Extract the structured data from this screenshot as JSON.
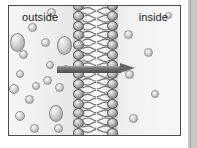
{
  "figure": {
    "labels": {
      "left_compartment": "outside",
      "right_compartment": "inside"
    },
    "arrow": {
      "name": "net-diffusion-arrow",
      "direction": "left-to-right",
      "meaning": "net movement of solute from outside to inside",
      "color": "#666666",
      "x_start": 57,
      "x_end": 136,
      "y": 69
    },
    "membrane": {
      "name": "phospholipid-bilayer",
      "orientation": "vertical",
      "x_left": 64,
      "x_right": 109,
      "width": 45,
      "head_count_per_leaflet": 16,
      "head_color": "#8d8d8d",
      "tail_color": "#5a5a5a",
      "description": "two leaflets of phospholipid heads with interdigitated wavy hydrophobic tails"
    },
    "colors": {
      "page_background": "#ffffff",
      "outer_background": "#c9c9c9",
      "frame_border": "#4c4c4c",
      "figure_fill": "#f2f2f2",
      "molecule_fill": "#d8d8d8",
      "molecule_stroke": "#8f8f8f",
      "arrow": "#666666",
      "text": "#1b1b1b"
    },
    "concentration": {
      "outside": "high",
      "inside": "low",
      "outside_molecule_count": 18,
      "inside_molecule_count": 6
    },
    "molecules_outside": [
      {
        "x": 1,
        "y": 27,
        "w": 15,
        "h": 19,
        "shape": "oval"
      },
      {
        "x": 10,
        "y": 44,
        "w": 9,
        "h": 9,
        "shape": "circle"
      },
      {
        "x": 19,
        "y": 17,
        "w": 9,
        "h": 9,
        "shape": "circle"
      },
      {
        "x": 7,
        "y": 64,
        "w": 8,
        "h": 8,
        "shape": "circle"
      },
      {
        "x": 0,
        "y": 78,
        "w": 10,
        "h": 10,
        "shape": "circle"
      },
      {
        "x": 16,
        "y": 89,
        "w": 9,
        "h": 9,
        "shape": "circle"
      },
      {
        "x": 6,
        "y": 105,
        "w": 10,
        "h": 10,
        "shape": "circle"
      },
      {
        "x": 21,
        "y": 118,
        "w": 9,
        "h": 9,
        "shape": "circle"
      },
      {
        "x": 32,
        "y": 32,
        "w": 9,
        "h": 9,
        "shape": "circle"
      },
      {
        "x": 37,
        "y": 55,
        "w": 8,
        "h": 8,
        "shape": "circle"
      },
      {
        "x": 34,
        "y": 70,
        "w": 9,
        "h": 9,
        "shape": "circle"
      },
      {
        "x": 40,
        "y": 99,
        "w": 14,
        "h": 17,
        "shape": "oval"
      },
      {
        "x": 38,
        "y": 2,
        "w": 9,
        "h": 9,
        "shape": "circle"
      },
      {
        "x": 48,
        "y": 30,
        "w": 15,
        "h": 19,
        "shape": "oval"
      },
      {
        "x": 46,
        "y": 77,
        "w": 9,
        "h": 9,
        "shape": "circle"
      },
      {
        "x": 45,
        "y": 118,
        "w": 9,
        "h": 9,
        "shape": "circle"
      },
      {
        "x": 53,
        "y": 59,
        "w": 8,
        "h": 8,
        "shape": "circle"
      },
      {
        "x": 23,
        "y": 76,
        "w": 8,
        "h": 8,
        "shape": "circle"
      }
    ],
    "molecules_inside": [
      {
        "x": 6,
        "y": 24,
        "w": 9,
        "h": 9,
        "shape": "circle"
      },
      {
        "x": 26,
        "y": 42,
        "w": 9,
        "h": 9,
        "shape": "circle"
      },
      {
        "x": 7,
        "y": 64,
        "w": 9,
        "h": 9,
        "shape": "circle"
      },
      {
        "x": 33,
        "y": 84,
        "w": 8,
        "h": 8,
        "shape": "circle"
      },
      {
        "x": 11,
        "y": 108,
        "w": 9,
        "h": 9,
        "shape": "circle"
      },
      {
        "x": 47,
        "y": 6,
        "w": 7,
        "h": 7,
        "shape": "circle"
      }
    ]
  }
}
